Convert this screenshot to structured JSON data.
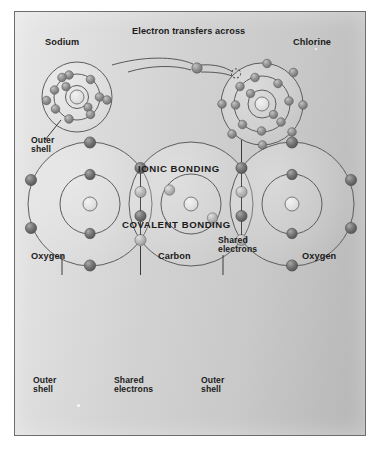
{
  "figure": {
    "title_ionic": "IONIC BONDING",
    "title_covalent": "COVALENT BONDING",
    "background_gradient_from": "#e8e8e8",
    "background_gradient_to": "#b6b6b6",
    "frame_border_color": "#6d6d6d"
  },
  "ionic": {
    "left_atom_label": "Sodium",
    "right_atom_label": "Chlorine",
    "transfer_label": "Electron transfers across",
    "outer_shell_label": "Outer\nshell",
    "sodium": {
      "element": "Sodium",
      "shells": [
        2,
        8,
        1
      ],
      "shell_radii": [
        11,
        23,
        35
      ],
      "nucleus_radius": 7,
      "center": [
        62,
        85
      ]
    },
    "chlorine": {
      "element": "Chlorine",
      "shells": [
        2,
        8,
        7
      ],
      "shell_radii": [
        13,
        26,
        40
      ],
      "nucleus_radius": 7,
      "center": [
        247,
        92
      ],
      "vacancy_marker": "dashed-circle"
    }
  },
  "covalent": {
    "molecule_atoms": [
      "Oxygen",
      "Carbon",
      "Oxygen"
    ],
    "left_atom_label": "Oxygen",
    "center_atom_label": "Carbon",
    "right_atom_label": "Oxygen",
    "shared_label_top": "Shared\nelectrons",
    "shared_label_bottom": "Shared\nelectrons",
    "outer_shell_label_left": "Outer\nshell",
    "outer_shell_label_right": "Outer\nshell",
    "oxygen_left": {
      "element": "Oxygen",
      "shells": [
        2,
        6
      ],
      "outer_radius": 62,
      "inner_radius": 30,
      "nucleus_radius": 7,
      "center": [
        75,
        192
      ]
    },
    "carbon": {
      "element": "Carbon",
      "shells": [
        2,
        4
      ],
      "outer_radius": 62,
      "inner_radius": 30,
      "nucleus_radius": 7,
      "center": [
        176,
        192
      ]
    },
    "oxygen_right": {
      "element": "Oxygen",
      "shells": [
        2,
        6
      ],
      "outer_radius": 62,
      "inner_radius": 30,
      "nucleus_radius": 7,
      "center": [
        277,
        192
      ]
    },
    "shared_pairs_per_bond": 4
  },
  "colors": {
    "electron_dark": "#6e6e6e",
    "electron_mid": "#8d8d8d",
    "electron_light": "#b9b9b9",
    "nucleus_fill": "#e2e2e2",
    "shell_stroke": "#5d5d5d",
    "text": "#1b1b1b"
  }
}
